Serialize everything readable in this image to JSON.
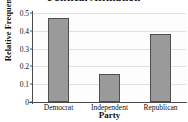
{
  "chart_data": {
    "type": "bar",
    "title": "Political Affiliation",
    "xlabel": "Party",
    "ylabel": "Relative Frequency",
    "categories": [
      "Democrat",
      "Independent",
      "Republican"
    ],
    "values": [
      0.47,
      0.16,
      0.38
    ],
    "ylim": [
      0,
      0.5
    ],
    "ytick_labels": [
      "0",
      "0.1",
      "0.2",
      "0.3",
      "0.4",
      "0.5"
    ],
    "ytick_values": [
      0,
      0.1,
      0.2,
      0.3,
      0.4,
      0.5
    ],
    "grid": true,
    "legend": "none",
    "bar_color": "#9a9a9a",
    "bar_edge_color": "#4f4f4f",
    "axis_color": "#4a4a4a",
    "gridline_color": "#e2e2e2",
    "plot_background": "#fdfdfd"
  }
}
